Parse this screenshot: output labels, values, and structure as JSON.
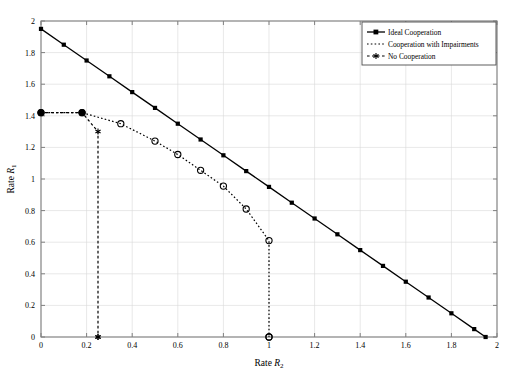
{
  "chart_data": {
    "type": "line",
    "title": "",
    "xlabel": "Rate R2",
    "ylabel": "Rate R1",
    "xlabel_base": "Rate ",
    "xlabel_var": "R",
    "xlabel_sub": "2",
    "ylabel_base": "Rate ",
    "ylabel_var": "R",
    "ylabel_sub": "1",
    "xlim": [
      0,
      2
    ],
    "ylim": [
      0,
      2
    ],
    "xticks": [
      0,
      0.2,
      0.4,
      0.6,
      0.8,
      1.0,
      1.2,
      1.4,
      1.6,
      1.8,
      2.0
    ],
    "yticks": [
      0,
      0.2,
      0.4,
      0.6,
      0.8,
      1.0,
      1.2,
      1.4,
      1.6,
      1.8,
      2.0
    ],
    "xtick_labels": [
      "0",
      "0.2",
      "0.4",
      "0.6",
      "0.8",
      "1",
      "1.2",
      "1.4",
      "1.6",
      "1.8",
      "2"
    ],
    "ytick_labels": [
      "0",
      "0.2",
      "0.4",
      "0.6",
      "0.8",
      "1",
      "1.2",
      "1.4",
      "1.6",
      "1.8",
      "2"
    ],
    "grid": true,
    "grid_color": "#d9d9d9",
    "frame_color": "#808080",
    "background": "#ffffff",
    "legend_position": "top-right",
    "series": [
      {
        "name": "Ideal Cooperation",
        "linestyle": "solid",
        "marker": "filled-square",
        "color": "#000000",
        "points": [
          [
            0.0,
            1.95
          ],
          [
            0.1,
            1.85
          ],
          [
            0.2,
            1.75
          ],
          [
            0.3,
            1.65
          ],
          [
            0.4,
            1.55
          ],
          [
            0.5,
            1.45
          ],
          [
            0.6,
            1.35
          ],
          [
            0.7,
            1.25
          ],
          [
            0.8,
            1.15
          ],
          [
            0.9,
            1.05
          ],
          [
            1.0,
            0.95
          ],
          [
            1.1,
            0.85
          ],
          [
            1.2,
            0.75
          ],
          [
            1.3,
            0.65
          ],
          [
            1.4,
            0.55
          ],
          [
            1.5,
            0.45
          ],
          [
            1.6,
            0.35
          ],
          [
            1.7,
            0.25
          ],
          [
            1.8,
            0.15
          ],
          [
            1.9,
            0.05
          ],
          [
            1.95,
            0.0
          ]
        ]
      },
      {
        "name": "Cooperation with Impairments",
        "linestyle": "dotted",
        "marker": "open-circle",
        "color": "#000000",
        "points": [
          [
            0.0,
            1.42
          ],
          [
            0.18,
            1.42
          ],
          [
            0.35,
            1.35
          ],
          [
            0.5,
            1.24
          ],
          [
            0.6,
            1.155
          ],
          [
            0.7,
            1.055
          ],
          [
            0.8,
            0.955
          ],
          [
            0.9,
            0.81
          ],
          [
            1.0,
            0.61
          ],
          [
            1.0,
            0.0
          ]
        ]
      },
      {
        "name": "No Cooperation",
        "linestyle": "dashed",
        "marker": "star",
        "color": "#000000",
        "points": [
          [
            0.0,
            1.42
          ],
          [
            0.18,
            1.42
          ],
          [
            0.25,
            1.3
          ],
          [
            0.25,
            0.0
          ]
        ]
      }
    ],
    "annotations": []
  },
  "legend": {
    "items": [
      {
        "label": "Ideal Cooperation",
        "marker": "filled-square",
        "linestyle": "solid"
      },
      {
        "label": "Cooperation with Impairments",
        "marker": "none",
        "linestyle": "dotted"
      },
      {
        "label": "No Cooperation",
        "marker": "star",
        "linestyle": "dashed"
      }
    ]
  }
}
